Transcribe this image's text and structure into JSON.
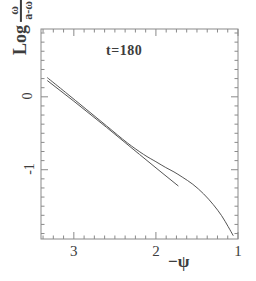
{
  "chart_data": {
    "type": "line",
    "title": "",
    "annotation": "t=180",
    "xlabel": "−ψ",
    "ylabel_prefix": "Log",
    "ylabel_numerator": "ω",
    "ylabel_denominator": "a-ω",
    "ylabel": "Log ω/(a-ω)",
    "xlim": [
      3.4,
      1.0
    ],
    "ylim": [
      -1.95,
      0.93
    ],
    "x_ticks_major": [
      3,
      2,
      1
    ],
    "x_tick_labels": [
      "3",
      "2",
      "1"
    ],
    "y_ticks_major": [
      0,
      -1
    ],
    "y_tick_labels": [
      "0",
      "-1"
    ],
    "x_minor_tick_step": 0.125,
    "y_minor_tick_step": 0.125,
    "grid": false,
    "legend": false,
    "axis_direction_note": "x axis decreases left to right",
    "series": [
      {
        "name": "reference-straight-line",
        "style": "solid-thin",
        "color": "#555555",
        "x": [
          3.32,
          3.0,
          2.6,
          2.2,
          1.95,
          1.73
        ],
        "y": [
          0.22,
          -0.06,
          -0.42,
          -0.79,
          -1.02,
          -1.22
        ]
      },
      {
        "name": "data-curve",
        "style": "solid-thin",
        "color": "#555555",
        "x": [
          3.32,
          3.1,
          2.85,
          2.6,
          2.35,
          2.15,
          2.0,
          1.88,
          1.78,
          1.68,
          1.55,
          1.42,
          1.3,
          1.2,
          1.12,
          1.06
        ],
        "y": [
          0.26,
          0.06,
          -0.17,
          -0.4,
          -0.63,
          -0.79,
          -0.89,
          -0.97,
          -1.03,
          -1.1,
          -1.2,
          -1.33,
          -1.48,
          -1.63,
          -1.78,
          -1.9
        ]
      }
    ]
  },
  "axes": {
    "frame_color": "#8a8a8a",
    "line_color": "#555555",
    "background": "#ffffff"
  }
}
